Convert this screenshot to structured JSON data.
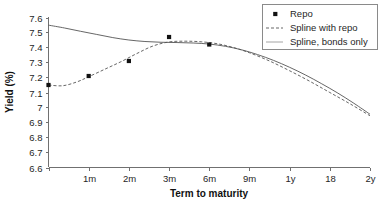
{
  "chart_data": {
    "type": "line",
    "title": "",
    "xlabel": "Term to maturity",
    "ylabel": "Yield (%)",
    "grid": false,
    "legend_position": "top-right",
    "x_categories": [
      "1m",
      "2m",
      "3m",
      "6m",
      "9m",
      "1y",
      "18",
      "2y"
    ],
    "x_tick_labels": [
      "",
      "1m",
      "2m",
      "3m",
      "6m",
      "9m",
      "1y",
      "18",
      "2y"
    ],
    "y_tick_labels": [
      "7.6",
      "7.5",
      "7.4",
      "7.3",
      "7.2",
      "7.1",
      "7",
      "6.9",
      "6.8",
      "6.7",
      "6.6"
    ],
    "ylim": [
      6.6,
      7.6
    ],
    "y_tick_step": 0.1,
    "xlim_index": [
      0,
      8
    ],
    "series": [
      {
        "name": "Repo",
        "type": "scatter",
        "marker": "square",
        "color": "#111111",
        "points": [
          {
            "x_index": 0,
            "x_label": "0",
            "y": 7.15
          },
          {
            "x_index": 1,
            "x_label": "1m",
            "y": 7.21
          },
          {
            "x_index": 2,
            "x_label": "2m",
            "y": 7.31
          },
          {
            "x_index": 3,
            "x_label": "3m",
            "y": 7.47
          },
          {
            "x_index": 4,
            "x_label": "6m",
            "y": 7.42
          }
        ]
      },
      {
        "name": "Spline with repo",
        "type": "line",
        "style": "dashed",
        "color": "#555555",
        "x_index": [
          0,
          0.35,
          0.7,
          1,
          1.4,
          1.8,
          2.2,
          2.6,
          3,
          3.4,
          3.8,
          4.2,
          4.6,
          5,
          5.5,
          6,
          6.5,
          7,
          7.5,
          8
        ],
        "values": [
          7.15,
          7.145,
          7.17,
          7.205,
          7.255,
          7.305,
          7.36,
          7.41,
          7.437,
          7.442,
          7.438,
          7.425,
          7.4,
          7.365,
          7.31,
          7.245,
          7.175,
          7.1,
          7.025,
          6.945
        ]
      },
      {
        "name": "Spline, bonds only",
        "type": "line",
        "style": "solid",
        "color": "#555555",
        "x_index": [
          0,
          0.4,
          0.8,
          1.2,
          1.6,
          2,
          2.4,
          2.8,
          3.2,
          3.6,
          4,
          4.4,
          4.8,
          5.2,
          5.6,
          6,
          6.4,
          6.8,
          7.2,
          7.6,
          8
        ],
        "values": [
          7.549,
          7.53,
          7.508,
          7.487,
          7.466,
          7.45,
          7.44,
          7.435,
          7.433,
          7.43,
          7.423,
          7.408,
          7.385,
          7.353,
          7.314,
          7.268,
          7.216,
          7.158,
          7.096,
          7.028,
          6.955
        ]
      }
    ],
    "legend": [
      {
        "label": "Repo",
        "swatch": "marker-square"
      },
      {
        "label": "Spline with repo",
        "swatch": "dashed-line"
      },
      {
        "label": "Spline, bonds only",
        "swatch": "solid-line-faint"
      }
    ]
  },
  "colors": {
    "axis": "#707070",
    "text": "#262626",
    "marker": "#111111",
    "curve": "#555555",
    "legend_border": "#8a8a8a",
    "background": "#ffffff"
  }
}
